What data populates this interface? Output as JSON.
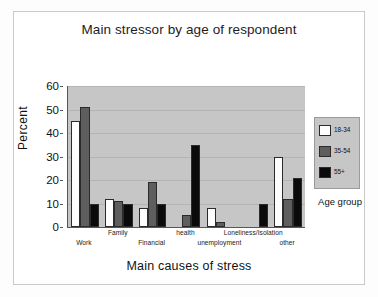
{
  "chart_data": {
    "type": "bar",
    "title": "Main stressor by age of respondent",
    "xlabel": "Main causes of stress",
    "ylabel": "Percent",
    "ylim": [
      0,
      60
    ],
    "yticks": [
      0,
      10,
      20,
      30,
      40,
      50,
      60
    ],
    "grid": true,
    "legend_title": "Age group",
    "legend_position": "right",
    "categories": [
      "Work",
      "Family",
      "Financial",
      "health",
      "unemployment",
      "Loneliness/Isolation",
      "other"
    ],
    "series": [
      {
        "name": "18-34",
        "color": "#fdfdfd",
        "values": [
          45,
          12,
          8,
          0,
          8,
          0,
          30
        ]
      },
      {
        "name": "35-54",
        "color": "#5e5e5e",
        "values": [
          51,
          11,
          19,
          5,
          2,
          0,
          12
        ]
      },
      {
        "name": "55+",
        "color": "#0a0a0a",
        "values": [
          10,
          10,
          10,
          35,
          0,
          10,
          21
        ]
      }
    ]
  }
}
